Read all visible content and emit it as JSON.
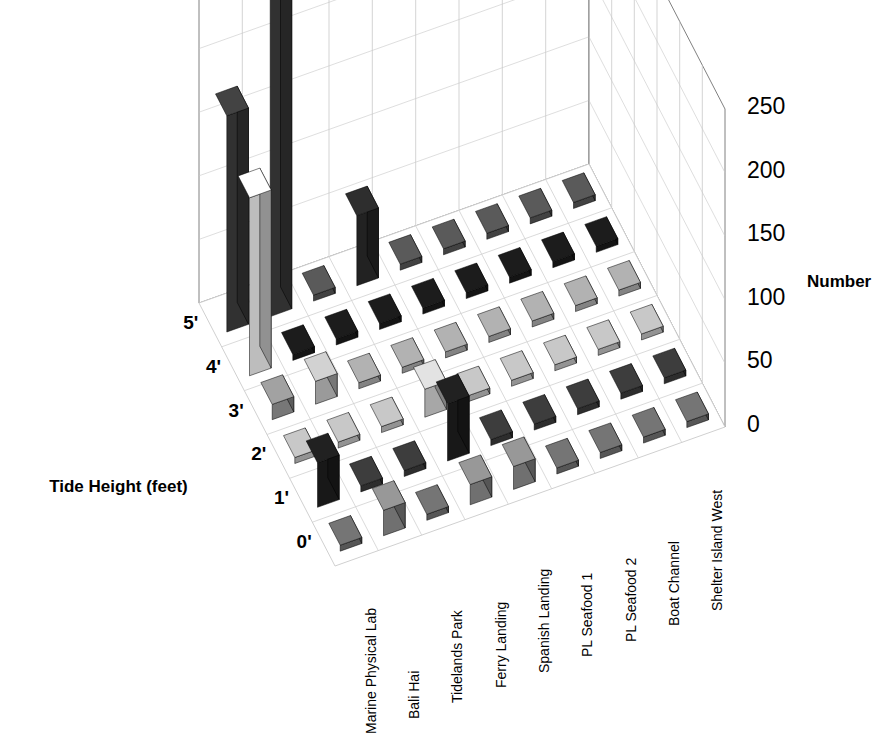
{
  "title": "Rough Limpet",
  "axes": {
    "value_axis_title": "Number",
    "value_ticks": [
      "0",
      "50",
      "100",
      "150",
      "200",
      "250"
    ],
    "depth_axis_title": "Tide Height (feet)",
    "depth_ticks": [
      "5'",
      "4'",
      "3'",
      "2'",
      "1'",
      "0'"
    ],
    "category_labels": [
      "Marine Physical Lab",
      "Bali Hai",
      "Tidelands Park",
      "Ferry Landing",
      "Spanish Landing",
      "PL Seafood 1",
      "PL Seafood 2",
      "Boat Channel",
      "Shelter Island West"
    ]
  },
  "colors": {
    "background": "#ffffff",
    "frame_line": "#808080",
    "grid_line": "#c8c8c8",
    "floor_line": "#d0d0d0",
    "series_5ft": "#3f3f3f",
    "series_4ft": "#111111",
    "series_3ft": "#8c8c8c",
    "series_2ft": "#bdbdbd",
    "series_1ft": "#8c8c8c",
    "series_0ft": "#6e6e6e",
    "highlight_white": "#f2f2f2",
    "text": "#000000"
  },
  "chart_data": {
    "type": "bar",
    "title": "Rough Limpet",
    "xlabel": "",
    "ylabel": "Number",
    "zlabel": "Tide Height (feet)",
    "ylim": [
      0,
      250
    ],
    "grid": true,
    "legend": "none",
    "projection": "3d",
    "categories": [
      "Marine Physical Lab",
      "Bali Hai",
      "Tidelands Park",
      "Ferry Landing",
      "Spanish Landing",
      "PL Seafood 1",
      "PL Seafood 2",
      "Boat Channel",
      "Shelter Island West"
    ],
    "series": [
      {
        "name": "5'",
        "color": "#3f3f3f",
        "values": [
          170,
          250,
          0,
          0,
          55,
          0,
          0,
          0,
          0
        ]
      },
      {
        "name": "4'",
        "color": "#111111",
        "values": [
          0,
          0,
          0,
          0,
          0,
          0,
          0,
          0,
          0
        ]
      },
      {
        "name": "3'",
        "color": "#8c8c8c",
        "values": [
          0,
          0,
          0,
          0,
          0,
          0,
          0,
          0,
          0
        ]
      },
      {
        "name": "2'",
        "color": "#bdbdbd",
        "values": [
          130,
          0,
          0,
          18,
          0,
          0,
          0,
          0,
          0
        ]
      },
      {
        "name": "1'",
        "color": "#8c8c8c",
        "values": [
          10,
          0,
          0,
          0,
          12,
          0,
          0,
          0,
          0
        ]
      },
      {
        "name": "0'",
        "color": "#6e6e6e",
        "values": [
          0,
          0,
          0,
          0,
          0,
          0,
          0,
          0,
          0
        ]
      }
    ],
    "cells": [
      {
        "row": "5'",
        "col": "Marine Physical Lab",
        "value": 170,
        "shade": "#3f3f3f"
      },
      {
        "row": "5'",
        "col": "Bali Hai",
        "value": 250,
        "shade": "#3f3f3f"
      },
      {
        "row": "5'",
        "col": "Tidelands Park",
        "value": 0,
        "shade": "#555555"
      },
      {
        "row": "5'",
        "col": "Ferry Landing",
        "value": 55,
        "shade": "#2b2b2b"
      },
      {
        "row": "5'",
        "col": "Spanish Landing",
        "value": 0,
        "shade": "#555555"
      },
      {
        "row": "5'",
        "col": "PL Seafood 1",
        "value": 0,
        "shade": "#555555"
      },
      {
        "row": "5'",
        "col": "PL Seafood 2",
        "value": 0,
        "shade": "#555555"
      },
      {
        "row": "5'",
        "col": "Boat Channel",
        "value": 0,
        "shade": "#555555"
      },
      {
        "row": "5'",
        "col": "Shelter Island West",
        "value": 0,
        "shade": "#555555"
      },
      {
        "row": "4'",
        "col": "Marine Physical Lab",
        "value": 140,
        "shade": "#f2f2f2"
      },
      {
        "row": "4'",
        "col": "Bali Hai",
        "value": 0,
        "shade": "#1a1a1a"
      },
      {
        "row": "4'",
        "col": "Tidelands Park",
        "value": 0,
        "shade": "#1a1a1a"
      },
      {
        "row": "4'",
        "col": "Ferry Landing",
        "value": 0,
        "shade": "#1a1a1a"
      },
      {
        "row": "4'",
        "col": "Spanish Landing",
        "value": 0,
        "shade": "#1a1a1a"
      },
      {
        "row": "4'",
        "col": "PL Seafood 1",
        "value": 0,
        "shade": "#1a1a1a"
      },
      {
        "row": "4'",
        "col": "PL Seafood 2",
        "value": 0,
        "shade": "#1a1a1a"
      },
      {
        "row": "4'",
        "col": "Boat Channel",
        "value": 0,
        "shade": "#1a1a1a"
      },
      {
        "row": "4'",
        "col": "Shelter Island West",
        "value": 0,
        "shade": "#1a1a1a"
      },
      {
        "row": "3'",
        "col": "Marine Physical Lab",
        "value": 12,
        "shade": "#999999"
      },
      {
        "row": "3'",
        "col": "Bali Hai",
        "value": 18,
        "shade": "#c6c6c6"
      },
      {
        "row": "3'",
        "col": "Tidelands Park",
        "value": 0,
        "shade": "#a8a8a8"
      },
      {
        "row": "3'",
        "col": "Ferry Landing",
        "value": 0,
        "shade": "#a8a8a8"
      },
      {
        "row": "3'",
        "col": "Spanish Landing",
        "value": 0,
        "shade": "#a8a8a8"
      },
      {
        "row": "3'",
        "col": "PL Seafood 1",
        "value": 0,
        "shade": "#a8a8a8"
      },
      {
        "row": "3'",
        "col": "PL Seafood 2",
        "value": 0,
        "shade": "#a8a8a8"
      },
      {
        "row": "3'",
        "col": "Boat Channel",
        "value": 0,
        "shade": "#a8a8a8"
      },
      {
        "row": "3'",
        "col": "Shelter Island West",
        "value": 0,
        "shade": "#a8a8a8"
      },
      {
        "row": "2'",
        "col": "Marine Physical Lab",
        "value": 0,
        "shade": "#bdbdbd"
      },
      {
        "row": "2'",
        "col": "Bali Hai",
        "value": 0,
        "shade": "#bdbdbd"
      },
      {
        "row": "2'",
        "col": "Tidelands Park",
        "value": 0,
        "shade": "#bdbdbd"
      },
      {
        "row": "2'",
        "col": "Ferry Landing",
        "value": 22,
        "shade": "#d6d6d6"
      },
      {
        "row": "2'",
        "col": "Spanish Landing",
        "value": 0,
        "shade": "#bdbdbd"
      },
      {
        "row": "2'",
        "col": "PL Seafood 1",
        "value": 0,
        "shade": "#bdbdbd"
      },
      {
        "row": "2'",
        "col": "PL Seafood 2",
        "value": 0,
        "shade": "#bdbdbd"
      },
      {
        "row": "2'",
        "col": "Boat Channel",
        "value": 0,
        "shade": "#bdbdbd"
      },
      {
        "row": "2'",
        "col": "Shelter Island West",
        "value": 0,
        "shade": "#bdbdbd"
      },
      {
        "row": "1'",
        "col": "Marine Physical Lab",
        "value": 35,
        "shade": "#1f1f1f"
      },
      {
        "row": "1'",
        "col": "Bali Hai",
        "value": 0,
        "shade": "#3a3a3a"
      },
      {
        "row": "1'",
        "col": "Tidelands Park",
        "value": 0,
        "shade": "#3a3a3a"
      },
      {
        "row": "1'",
        "col": "Ferry Landing",
        "value": 45,
        "shade": "#1f1f1f"
      },
      {
        "row": "1'",
        "col": "Spanish Landing",
        "value": 0,
        "shade": "#3a3a3a"
      },
      {
        "row": "1'",
        "col": "PL Seafood 1",
        "value": 0,
        "shade": "#3a3a3a"
      },
      {
        "row": "1'",
        "col": "PL Seafood 2",
        "value": 0,
        "shade": "#3a3a3a"
      },
      {
        "row": "1'",
        "col": "Boat Channel",
        "value": 0,
        "shade": "#3a3a3a"
      },
      {
        "row": "1'",
        "col": "Shelter Island West",
        "value": 0,
        "shade": "#3a3a3a"
      },
      {
        "row": "0'",
        "col": "Marine Physical Lab",
        "value": 0,
        "shade": "#6e6e6e"
      },
      {
        "row": "0'",
        "col": "Bali Hai",
        "value": 20,
        "shade": "#8f8f8f"
      },
      {
        "row": "0'",
        "col": "Tidelands Park",
        "value": 0,
        "shade": "#6e6e6e"
      },
      {
        "row": "0'",
        "col": "Ferry Landing",
        "value": 16,
        "shade": "#8f8f8f"
      },
      {
        "row": "0'",
        "col": "Spanish Landing",
        "value": 18,
        "shade": "#8f8f8f"
      },
      {
        "row": "0'",
        "col": "PL Seafood 1",
        "value": 0,
        "shade": "#6e6e6e"
      },
      {
        "row": "0'",
        "col": "PL Seafood 2",
        "value": 0,
        "shade": "#6e6e6e"
      },
      {
        "row": "0'",
        "col": "Boat Channel",
        "value": 0,
        "shade": "#6e6e6e"
      },
      {
        "row": "0'",
        "col": "Shelter Island West",
        "value": 0,
        "shade": "#6e6e6e"
      }
    ]
  }
}
